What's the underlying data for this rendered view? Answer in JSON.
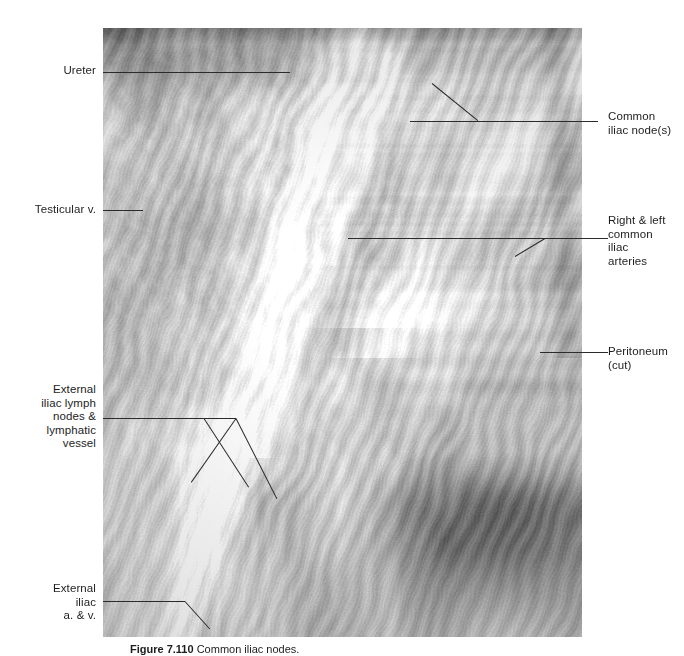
{
  "figure": {
    "domain_note": "anatomical dissection photograph with labeled leader lines",
    "photo": {
      "alt_name": "male pelvis dissection showing common and external iliac vessels and lymph nodes",
      "tone": "grayscale",
      "left": 103,
      "top": 28,
      "width": 479,
      "height": 609
    },
    "labels_left": [
      {
        "id": "ureter",
        "text": "Ureter",
        "text_x": 14,
        "text_y": 64,
        "text_w": 82,
        "leaders": [
          {
            "x": 103,
            "y": 72,
            "len": 187,
            "angle": 0
          }
        ]
      },
      {
        "id": "testicular-vein",
        "text": "Testicular v.",
        "text_x": 8,
        "text_y": 203,
        "text_w": 88,
        "leaders": [
          {
            "x": 103,
            "y": 210,
            "len": 40,
            "angle": 0
          }
        ]
      },
      {
        "id": "external-iliac-lymph-nodes",
        "text": "External\niliac lymph\nnodes &\nlymphatic\nvessel",
        "text_x": 6,
        "text_y": 383,
        "text_w": 90,
        "leaders": [
          {
            "x": 103,
            "y": 418,
            "len": 133,
            "angle": 0
          },
          {
            "x": 204,
            "y": 418,
            "len": 82,
            "angle": 57
          },
          {
            "x": 236,
            "y": 418,
            "len": 90,
            "angle": 63
          },
          {
            "x": 236,
            "y": 418,
            "len": 78,
            "angle": 125
          }
        ]
      },
      {
        "id": "external-iliac-a-v",
        "text": "External\niliac\na. & v.",
        "text_x": 10,
        "text_y": 582,
        "text_w": 86,
        "leaders": [
          {
            "x": 103,
            "y": 601,
            "len": 82,
            "angle": 0
          },
          {
            "x": 185,
            "y": 601,
            "len": 37,
            "angle": 48
          }
        ]
      }
    ],
    "labels_right": [
      {
        "id": "common-iliac-nodes",
        "text": "Common\niliac node(s)",
        "text_x": 608,
        "text_y": 110,
        "text_w": 76,
        "leaders": [
          {
            "x": 410,
            "y": 121,
            "len": 188,
            "angle": 0
          },
          {
            "x": 432,
            "y": 83,
            "len": 59,
            "angle": 39
          }
        ]
      },
      {
        "id": "right-left-common-iliac-arteries",
        "text": "Right & left\ncommon\niliac\narteries",
        "text_x": 608,
        "text_y": 214,
        "text_w": 76,
        "leaders": [
          {
            "x": 348,
            "y": 238,
            "len": 260,
            "angle": 0
          },
          {
            "x": 515,
            "y": 256,
            "len": 35,
            "angle": -31
          }
        ]
      },
      {
        "id": "peritoneum-cut",
        "text": "Peritoneum\n(cut)",
        "text_x": 608,
        "text_y": 345,
        "text_w": 76,
        "leaders": [
          {
            "x": 540,
            "y": 352,
            "len": 68,
            "angle": 0
          }
        ]
      }
    ],
    "caption": {
      "number": "Figure 7.110",
      "text": "Common iliac nodes."
    }
  }
}
